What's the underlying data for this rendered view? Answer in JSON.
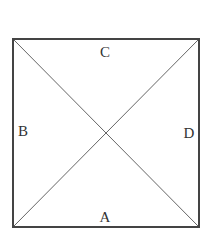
{
  "diagram": {
    "type": "square-with-diagonals",
    "square": {
      "x": 13,
      "y": 39,
      "width": 186,
      "height": 188
    },
    "stroke_color": "#444444",
    "diagonal_color": "#666666",
    "labels": [
      {
        "id": "C",
        "text": "C",
        "x": 105,
        "y": 57,
        "region": "top"
      },
      {
        "id": "B",
        "text": "B",
        "x": 22,
        "y": 136,
        "region": "left"
      },
      {
        "id": "D",
        "text": "D",
        "x": 189,
        "y": 138,
        "region": "right"
      },
      {
        "id": "A",
        "text": "A",
        "x": 105,
        "y": 222,
        "region": "bottom"
      }
    ]
  }
}
